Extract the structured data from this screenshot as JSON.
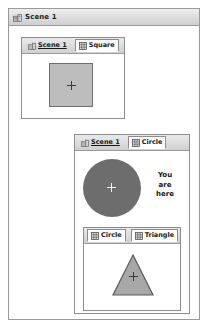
{
  "window": {
    "title": "Scene 1",
    "title_icon": "building-icon"
  },
  "panels": [
    {
      "id": "panel-square",
      "tabs": [
        {
          "label": "Scene 1",
          "icon": "building-icon",
          "style": "link",
          "active": false
        },
        {
          "label": "Square",
          "icon": "grid-icon",
          "style": "normal",
          "active": true
        }
      ],
      "shape": {
        "kind": "square",
        "marker": "crosshair"
      }
    },
    {
      "id": "panel-circle",
      "tabs": [
        {
          "label": "Scene 1",
          "icon": "building-icon",
          "style": "link",
          "active": false
        },
        {
          "label": "Circle",
          "icon": "grid-icon",
          "style": "normal",
          "active": true
        }
      ],
      "shape": {
        "kind": "circle",
        "marker": "crosshair"
      },
      "annotation": "You\nare\nhere"
    },
    {
      "id": "panel-triangle",
      "tabs": [
        {
          "label": "Circle",
          "icon": "grid-icon",
          "style": "normal",
          "active": true
        },
        {
          "label": "Triangle",
          "icon": "grid-icon",
          "style": "normal",
          "active": true
        }
      ],
      "shape": {
        "kind": "triangle",
        "marker": "crosshair"
      }
    }
  ],
  "colors": {
    "window_border": "#9a9a9a",
    "titlebar": "#dcdcdc",
    "tabbar": "#dadada",
    "square_fill": "#bdbdbd",
    "square_stroke": "#6f6f6f",
    "circle_fill": "#6d6d6d",
    "triangle_fill": "#a8a8a8",
    "triangle_stroke": "#5a5a5a"
  }
}
